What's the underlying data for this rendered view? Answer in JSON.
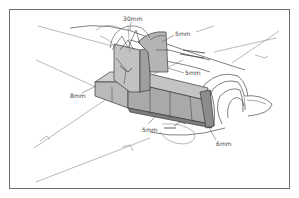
{
  "diagram": {
    "labels": [
      {
        "id": "canopy-armour",
        "text": "30mm",
        "x": 123,
        "y": 16
      },
      {
        "id": "head-armour",
        "text": "5mm",
        "x": 175,
        "y": 32
      },
      {
        "id": "bulkhead-armour",
        "text": "5mm",
        "x": 185,
        "y": 70
      },
      {
        "id": "side-armour",
        "text": "8mm",
        "x": 70,
        "y": 93
      },
      {
        "id": "floor-armour",
        "text": "5mm",
        "x": 142,
        "y": 127
      },
      {
        "id": "cowling-armour",
        "text": "6mm",
        "x": 217,
        "y": 142
      }
    ],
    "colors": {
      "line": "#4a4a4a",
      "armour_fill": "#b9b9b9",
      "armour_dark": "#8c8c8c",
      "frame": "#6e6e6e",
      "background": "#ffffff"
    }
  }
}
